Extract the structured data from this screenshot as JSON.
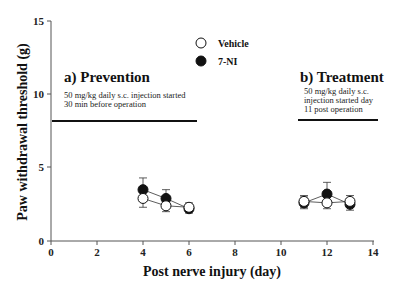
{
  "chart_data": {
    "type": "line",
    "title": "",
    "xlabel": "Post nerve injury (day)",
    "ylabel": "Paw withdrawal threshold (g)",
    "xlim": [
      0,
      14
    ],
    "ylim": [
      0,
      15
    ],
    "x_ticks": [
      "0",
      "2",
      "4",
      "6",
      "8",
      "10",
      "12",
      "14"
    ],
    "y_ticks": [
      "0",
      "5",
      "10",
      "15"
    ],
    "grid": false,
    "legend": {
      "position": "top-center",
      "entries": [
        {
          "name": "Vehicle",
          "marker": "open-circle"
        },
        {
          "name": "7-NI",
          "marker": "filled-circle"
        }
      ]
    },
    "series": [
      {
        "name": "Vehicle",
        "marker": "open-circle",
        "segments": [
          {
            "x": [
              4,
              5,
              6
            ],
            "y": [
              2.9,
              2.4,
              2.3
            ],
            "err": [
              0.6,
              0.4,
              0.3
            ]
          },
          {
            "x": [
              11,
              12,
              13
            ],
            "y": [
              2.7,
              2.6,
              2.7
            ],
            "err": [
              0.4,
              0.4,
              0.4
            ]
          }
        ]
      },
      {
        "name": "7-NI",
        "marker": "filled-circle",
        "segments": [
          {
            "x": [
              4,
              5,
              6
            ],
            "y": [
              3.5,
              2.9,
              2.2
            ],
            "err": [
              0.8,
              0.6,
              0.3
            ]
          },
          {
            "x": [
              11,
              12,
              13
            ],
            "y": [
              2.6,
              3.2,
              2.5
            ],
            "err": [
              0.4,
              0.8,
              0.4
            ]
          }
        ]
      }
    ],
    "annotations": [
      {
        "title": "a) Prevention",
        "lines": [
          "50 mg/kg daily s.c. injection started",
          "30 min before operation"
        ],
        "bar": {
          "x_start": 0,
          "x_end": 6.3,
          "y": 8.2
        }
      },
      {
        "title": "b) Treatment",
        "lines": [
          "50 mg/kg daily s.c.",
          "injection started day",
          "11 post operation"
        ],
        "bar": {
          "x_start": 10.7,
          "x_end": 14.2,
          "y": 8.2
        }
      }
    ]
  },
  "labels": {
    "xlabel": "Post nerve injury (day)",
    "ylabel": "Paw withdrawal threshold (g)",
    "legend_vehicle": "Vehicle",
    "legend_7ni": "7-NI",
    "panel_a_title": "a) Prevention",
    "panel_a_line1": "50 mg/kg daily s.c. injection started",
    "panel_a_line2": "30 min before operation",
    "panel_b_title": "b) Treatment",
    "panel_b_line1": "50 mg/kg daily s.c.",
    "panel_b_line2": "injection started day",
    "panel_b_line3": "11 post operation",
    "xticks": [
      "0",
      "2",
      "4",
      "6",
      "8",
      "10",
      "12",
      "14"
    ],
    "yticks": [
      "0",
      "5",
      "10",
      "15"
    ]
  },
  "colors": {
    "axis": "#555555",
    "marker_fill": "#111111",
    "marker_open": "#ffffff",
    "bar": "#111111"
  }
}
